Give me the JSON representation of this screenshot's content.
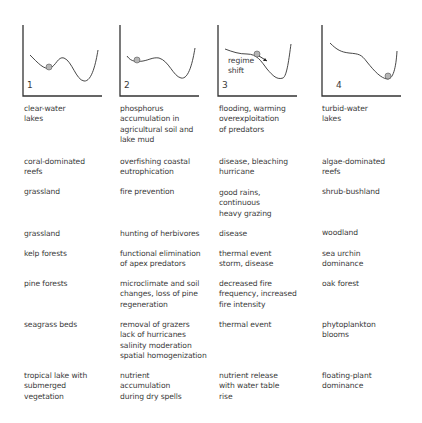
{
  "panels": [
    {
      "number": "1",
      "label": ""
    },
    {
      "number": "2",
      "label": ""
    },
    {
      "number": "3",
      "label": "regime\nshift"
    },
    {
      "number": "4",
      "label": ""
    }
  ],
  "rows": [
    {
      "state_a": "clear-water\nlakes",
      "driver_a": "phosphorus\naccumulation in\nagricultural soil and\nlake mud",
      "trigger": "flooding, warming\noverexploitation\nof predators",
      "state_b": "turbid-water\nlakes"
    },
    {
      "state_a": "coral-dominated\nreefs",
      "driver_a": "overfishing coastal\neutrophication",
      "trigger": "disease, bleaching\nhurricane",
      "state_b": "algae-dominated\nreefs"
    },
    {
      "state_a": "grassland",
      "driver_a": "fire prevention",
      "trigger": "good rains,\ncontinuous\nheavy grazing",
      "state_b": "shrub-bushland"
    },
    {
      "state_a": "grassland",
      "driver_a": "hunting of herbivores",
      "trigger": "disease",
      "state_b": "woodland"
    },
    {
      "state_a": "kelp forests",
      "driver_a": "functional elimination\nof apex predators",
      "trigger": "thermal event\nstorm, disease",
      "state_b": "sea urchin\ndominance"
    },
    {
      "state_a": "pine forests",
      "driver_a": "microclimate and soil\nchanges, loss of pine\nregeneration",
      "trigger": "decreased fire\nfrequency, increased\nfire intensity",
      "state_b": "oak forest"
    },
    {
      "state_a": "seagrass beds",
      "driver_a": "removal of grazers\nlack of hurricanes\nsalinity moderation\nspatial homogenization",
      "trigger": "thermal event",
      "state_b": "phytoplankton\nblooms"
    },
    {
      "state_a": "tropical lake with\nsubmerged\nvegetation",
      "driver_a": "nutrient\naccumulation\nduring dry spells",
      "trigger": "nutrient release\nwith water table\nrise",
      "state_b": "floating-plant\ndominance"
    }
  ],
  "colors": {
    "line": "#333333",
    "ball_fill": "#b5b5b5",
    "text": "#3a3a3a"
  }
}
